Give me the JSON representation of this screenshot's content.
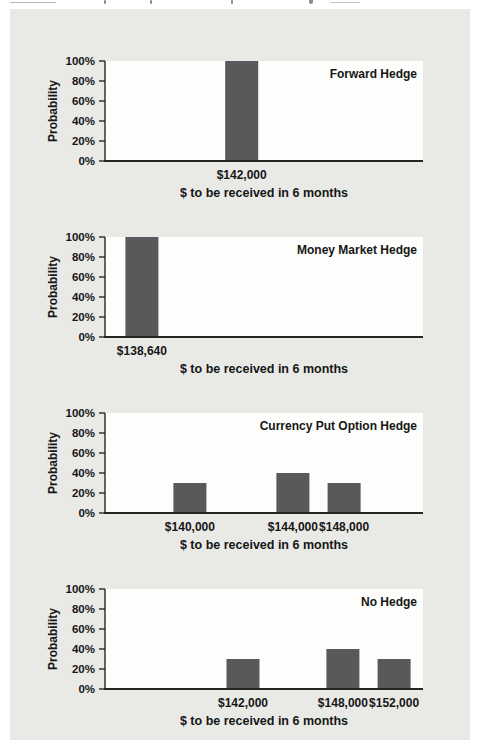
{
  "figure": {
    "panel_background": "#e9e9e6",
    "plot_background": "#fdfdfb",
    "bar_color": "#58595b",
    "axis_color": "#262626",
    "text_color": "#161616"
  },
  "chart_data": [
    {
      "type": "bar",
      "title": "Forward Hedge",
      "ylabel": "Probability",
      "xlabel": "$ to be received in 6 months",
      "ylim": [
        0,
        100
      ],
      "grid": false,
      "legend_position": "top-right-inside",
      "yticks": [
        0,
        20,
        40,
        60,
        80,
        100
      ],
      "ytick_labels": [
        "0%",
        "20%",
        "40%",
        "60%",
        "80%",
        "100%"
      ],
      "categories": [
        "$142,000"
      ],
      "values": [
        100
      ],
      "x_fracs": [
        0.43
      ]
    },
    {
      "type": "bar",
      "title": "Money Market Hedge",
      "ylabel": "Probability",
      "xlabel": "$ to be received in 6 months",
      "ylim": [
        0,
        100
      ],
      "grid": false,
      "legend_position": "top-right-inside",
      "yticks": [
        0,
        20,
        40,
        60,
        80,
        100
      ],
      "ytick_labels": [
        "0%",
        "20%",
        "40%",
        "60%",
        "80%",
        "100%"
      ],
      "categories": [
        "$138,640"
      ],
      "values": [
        100
      ],
      "x_fracs": [
        0.116
      ]
    },
    {
      "type": "bar",
      "title": "Currency Put Option Hedge",
      "ylabel": "Probability",
      "xlabel": "$ to be received in 6 months",
      "ylim": [
        0,
        100
      ],
      "grid": false,
      "legend_position": "top-right-inside",
      "yticks": [
        0,
        20,
        40,
        60,
        80,
        100
      ],
      "ytick_labels": [
        "0%",
        "20%",
        "40%",
        "60%",
        "80%",
        "100%"
      ],
      "categories": [
        "$140,000",
        "$144,000",
        "$148,000"
      ],
      "values": [
        30,
        40,
        30
      ],
      "x_fracs": [
        0.267,
        0.591,
        0.752
      ]
    },
    {
      "type": "bar",
      "title": "No Hedge",
      "ylabel": "Probability",
      "xlabel": "$ to be received in 6 months",
      "ylim": [
        0,
        100
      ],
      "grid": false,
      "legend_position": "top-right-inside",
      "yticks": [
        0,
        20,
        40,
        60,
        80,
        100
      ],
      "ytick_labels": [
        "0%",
        "20%",
        "40%",
        "60%",
        "80%",
        "100%"
      ],
      "categories": [
        "$142,000",
        "$148,000",
        "$152,000"
      ],
      "values": [
        30,
        40,
        30
      ],
      "x_fracs": [
        0.434,
        0.748,
        0.909
      ]
    }
  ]
}
